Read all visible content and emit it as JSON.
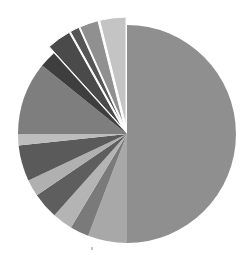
{
  "chart_data": {
    "type": "pie",
    "title": "",
    "legend": "none",
    "start_angle_deg": 0,
    "direction": "clockwise",
    "center": [
      127,
      134
    ],
    "radius": 109,
    "slices": [
      {
        "label": "",
        "value": 50.0,
        "color": "#8f8f8f",
        "exploded": false
      },
      {
        "label": "",
        "value": 5.8,
        "color": "#a8a8a8",
        "exploded": false
      },
      {
        "label": "",
        "value": 2.8,
        "color": "#7a7a7a",
        "exploded": false
      },
      {
        "label": "",
        "value": 3.0,
        "color": "#b4b4b4",
        "exploded": false
      },
      {
        "label": "",
        "value": 3.9,
        "color": "#5e5e5e",
        "exploded": false
      },
      {
        "label": "",
        "value": 2.5,
        "color": "#b0b0b0",
        "exploded": false
      },
      {
        "label": "",
        "value": 5.3,
        "color": "#5a5a5a",
        "exploded": false
      },
      {
        "label": "",
        "value": 1.7,
        "color": "#bdbdbd",
        "exploded": false
      },
      {
        "label": "",
        "value": 10.8,
        "color": "#7e7e7e",
        "exploded": false
      },
      {
        "label": "",
        "value": 2.5,
        "color": "#3e3e3e",
        "exploded": false
      },
      {
        "label": "",
        "value": 3.6,
        "color": "#4a4a4a",
        "exploded": true
      },
      {
        "label": "",
        "value": 1.4,
        "color": "#555555",
        "exploded": true
      },
      {
        "label": "",
        "value": 2.8,
        "color": "#909090",
        "exploded": true
      },
      {
        "label": "",
        "value": 3.9,
        "color": "#c4c4c4",
        "exploded": true
      }
    ],
    "explode_offset": 8
  }
}
